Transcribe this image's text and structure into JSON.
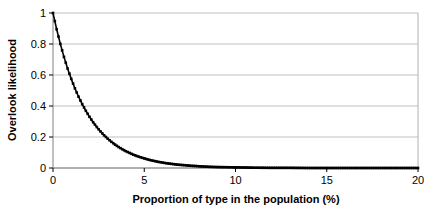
{
  "chart_data": {
    "type": "line",
    "title": "",
    "subtitle": "",
    "xlabel": "Proportion of type in the population (%)",
    "ylabel": "Overlook likelihood",
    "xlim": [
      0,
      20
    ],
    "ylim": [
      0,
      1
    ],
    "xticks": [
      0,
      5,
      10,
      15,
      20
    ],
    "xtick_labels": [
      "0",
      "5",
      "10",
      "15",
      "20"
    ],
    "yticks": [
      0,
      0.2,
      0.4,
      0.6,
      0.8,
      1
    ],
    "ytick_labels": [
      "0",
      "0.2",
      "0.4",
      "0.6",
      "0.8",
      "1"
    ],
    "grid": "horizontal",
    "grid_color": "#c0c0c0",
    "series_color": "#000000",
    "marker": "square",
    "legend": "none",
    "series": [
      {
        "name": "Overlook likelihood",
        "x": [
          0,
          0.2,
          0.4,
          0.6,
          0.8,
          1,
          1.2,
          1.4,
          1.6,
          1.8,
          2,
          2.2,
          2.4,
          2.6,
          2.8,
          3,
          3.2,
          3.4,
          3.6,
          3.8,
          4,
          4.2,
          4.4,
          4.6,
          4.8,
          5,
          5.2,
          5.4,
          5.6,
          5.8,
          6,
          6.2,
          6.4,
          6.6,
          6.8,
          7,
          7.2,
          7.4,
          7.6,
          7.8,
          8,
          8.5,
          9,
          9.5,
          10,
          11,
          12,
          13,
          14,
          15,
          16,
          17,
          18,
          19,
          20
        ],
        "values": [
          1,
          0.895,
          0.801,
          0.717,
          0.642,
          0.575,
          0.514,
          0.46,
          0.412,
          0.369,
          0.33,
          0.295,
          0.264,
          0.236,
          0.211,
          0.189,
          0.169,
          0.151,
          0.135,
          0.121,
          0.108,
          0.097,
          0.086,
          0.077,
          0.069,
          0.062,
          0.055,
          0.049,
          0.044,
          0.039,
          0.035,
          0.031,
          0.028,
          0.025,
          0.022,
          0.02,
          0.018,
          0.016,
          0.014,
          0.013,
          0.011,
          0.008,
          0.006,
          0.005,
          0.004,
          0.002,
          0.001,
          0.001,
          0,
          0,
          0,
          0,
          0,
          0,
          0
        ]
      }
    ]
  },
  "axes": {
    "y_title": "Overlook likelihood",
    "x_title": "Proportion of type in the population (%)"
  }
}
